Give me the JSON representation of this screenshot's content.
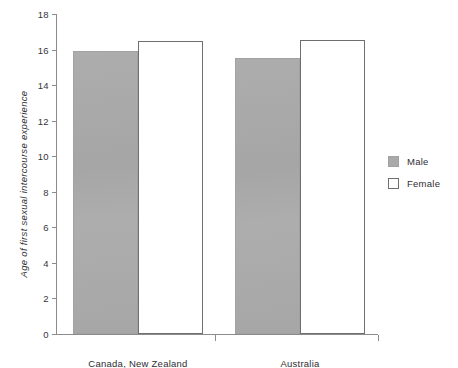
{
  "chart_data": {
    "type": "bar",
    "title": "",
    "xlabel": "",
    "ylabel": "Age of first sexual intercourse experience",
    "ylim": [
      0,
      18
    ],
    "ytick_step": 2,
    "yticks": [
      "18",
      "16",
      "14",
      "12",
      "10",
      "8",
      "6",
      "4",
      "2",
      "0"
    ],
    "grid": false,
    "legend_position": "right",
    "categories": [
      "Canada, New Zealand",
      "Australia"
    ],
    "series": [
      {
        "name": "Male",
        "values": [
          15.9,
          15.5
        ],
        "color": "#a9a9a9"
      },
      {
        "name": "Female",
        "values": [
          16.5,
          16.55
        ],
        "color": "#ffffff"
      }
    ]
  },
  "legend": {
    "items": [
      {
        "label": "Male",
        "swatch": "filled-gray-square"
      },
      {
        "label": "Female",
        "swatch": "outlined-white-square"
      }
    ]
  },
  "axes": {
    "y_title": "Age of first sexual intercourse experience",
    "y_labels": [
      "18",
      "16",
      "14",
      "12",
      "10",
      "8",
      "6",
      "4",
      "2",
      "0"
    ],
    "x_labels": [
      "Canada, New Zealand",
      "Australia"
    ]
  },
  "colors": {
    "male_fill": "#a9a9a9",
    "female_fill": "#ffffff",
    "axis": "#8c8c8c",
    "text": "#2e2e33",
    "background": "#ffffff"
  }
}
